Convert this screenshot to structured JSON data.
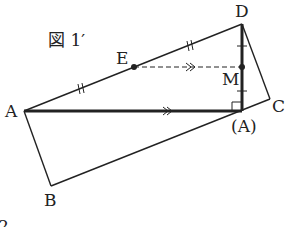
{
  "figure": {
    "title": "図 1′",
    "footer_partial": "2"
  },
  "points": {
    "A": {
      "label": "A",
      "x": 24,
      "y": 111
    },
    "B": {
      "label": "B",
      "x": 51,
      "y": 186
    },
    "C": {
      "label": "C",
      "x": 270,
      "y": 99
    },
    "D": {
      "label": "D",
      "x": 242,
      "y": 24
    },
    "A_prime": {
      "label": "(A)",
      "x": 242,
      "y": 111
    },
    "E": {
      "label": "E",
      "x": 134,
      "y": 67
    },
    "M": {
      "label": "M",
      "x": 242,
      "y": 67
    }
  },
  "segments": [
    {
      "from": "A",
      "to": "D",
      "style": "solid",
      "marks": "double-tick"
    },
    {
      "from": "A",
      "to": "A_prime",
      "style": "bold",
      "marks": "double-arrow"
    },
    {
      "from": "D",
      "to": "A_prime",
      "style": "bold",
      "marks": "single-tick"
    },
    {
      "from": "D",
      "to": "C",
      "style": "solid"
    },
    {
      "from": "C",
      "to": "B",
      "style": "solid"
    },
    {
      "from": "B",
      "to": "A",
      "style": "solid"
    },
    {
      "from": "E",
      "to": "M",
      "style": "dashed",
      "marks": "double-arrow"
    }
  ],
  "annotations": {
    "right_angle_at": "A_prime"
  },
  "colors": {
    "stroke": "#222222",
    "background": "#ffffff"
  }
}
